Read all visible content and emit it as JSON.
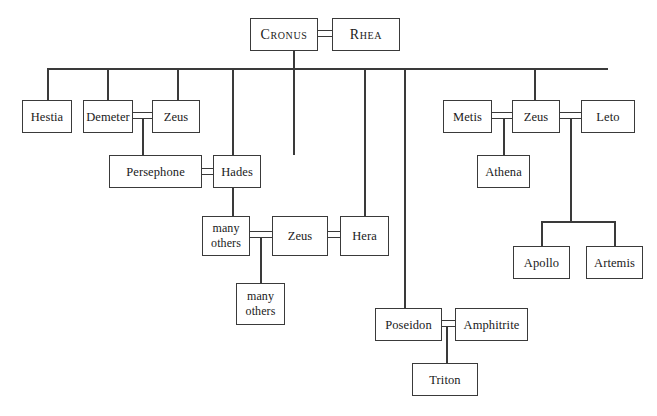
{
  "diagram": {
    "type": "family-tree",
    "line_color": "#3a3a3a",
    "box_fill": "#ffffff",
    "nodes": [
      {
        "id": "cronus",
        "label": "Cronus",
        "style": "smallcaps",
        "x": 250,
        "y": 18,
        "w": 68,
        "h": 33
      },
      {
        "id": "rhea",
        "label": "Rhea",
        "style": "smallcaps",
        "x": 332,
        "y": 18,
        "w": 68,
        "h": 33
      },
      {
        "id": "hestia",
        "label": "Hestia",
        "style": "normal",
        "x": 22,
        "y": 100,
        "w": 50,
        "h": 33
      },
      {
        "id": "demeter",
        "label": "Demeter",
        "style": "normal",
        "x": 83,
        "y": 100,
        "w": 50,
        "h": 33
      },
      {
        "id": "zeus1",
        "label": "Zeus",
        "style": "normal",
        "x": 152,
        "y": 100,
        "w": 48,
        "h": 33
      },
      {
        "id": "persephone",
        "label": "Persephone",
        "style": "normal",
        "x": 109,
        "y": 155,
        "w": 93,
        "h": 33
      },
      {
        "id": "hades",
        "label": "Hades",
        "style": "normal",
        "x": 213,
        "y": 155,
        "w": 48,
        "h": 33
      },
      {
        "id": "manyA",
        "label": "many\nothers",
        "style": "two-line",
        "x": 202,
        "y": 216,
        "w": 48,
        "h": 40
      },
      {
        "id": "zeus2",
        "label": "Zeus",
        "style": "normal",
        "x": 272,
        "y": 216,
        "w": 56,
        "h": 40
      },
      {
        "id": "hera",
        "label": "Hera",
        "style": "normal",
        "x": 340,
        "y": 216,
        "w": 49,
        "h": 40
      },
      {
        "id": "manyB",
        "label": "many\nothers",
        "style": "two-line",
        "x": 236,
        "y": 283,
        "w": 49,
        "h": 42
      },
      {
        "id": "metis",
        "label": "Metis",
        "style": "normal",
        "x": 443,
        "y": 100,
        "w": 49,
        "h": 33
      },
      {
        "id": "zeus3",
        "label": "Zeus",
        "style": "normal",
        "x": 512,
        "y": 100,
        "w": 48,
        "h": 33
      },
      {
        "id": "leto",
        "label": "Leto",
        "style": "normal",
        "x": 581,
        "y": 100,
        "w": 54,
        "h": 33
      },
      {
        "id": "athena",
        "label": "Athena",
        "style": "normal",
        "x": 477,
        "y": 155,
        "w": 53,
        "h": 33
      },
      {
        "id": "apollo",
        "label": "Apollo",
        "style": "normal",
        "x": 513,
        "y": 246,
        "w": 57,
        "h": 33
      },
      {
        "id": "artemis",
        "label": "Artemis",
        "style": "normal",
        "x": 586,
        "y": 246,
        "w": 57,
        "h": 33
      },
      {
        "id": "poseidon",
        "label": "Poseidon",
        "style": "normal",
        "x": 375,
        "y": 308,
        "w": 67,
        "h": 33
      },
      {
        "id": "amphitrite",
        "label": "Amphitrite",
        "style": "normal",
        "x": 455,
        "y": 308,
        "w": 73,
        "h": 33
      },
      {
        "id": "triton",
        "label": "Triton",
        "style": "normal",
        "x": 412,
        "y": 363,
        "w": 66,
        "h": 33
      }
    ],
    "marriages": [
      {
        "id": "cronus-rhea",
        "x": 318,
        "y": 30,
        "w": 14,
        "h": 5
      },
      {
        "id": "demeter-zeus",
        "x": 133,
        "y": 112,
        "w": 19,
        "h": 5
      },
      {
        "id": "persephone-hades",
        "x": 202,
        "y": 168,
        "w": 11,
        "h": 5
      },
      {
        "id": "manyothers-zeus",
        "x": 250,
        "y": 231,
        "w": 22,
        "h": 5
      },
      {
        "id": "zeus-hera",
        "x": 328,
        "y": 231,
        "w": 12,
        "h": 5
      },
      {
        "id": "metis-zeus",
        "x": 492,
        "y": 112,
        "w": 20,
        "h": 5
      },
      {
        "id": "zeus-leto",
        "x": 560,
        "y": 112,
        "w": 21,
        "h": 5
      },
      {
        "id": "poseidon-amphitrite",
        "x": 442,
        "y": 320,
        "w": 13,
        "h": 5
      }
    ],
    "connectors": {
      "descent_from_cronus_rhea": {
        "x": 293,
        "y_from": 35,
        "y_to": 68
      },
      "sibling_bar": {
        "y": 68,
        "x_from": 47,
        "x_to": 608
      },
      "drops": [
        {
          "id": "to-hestia",
          "x": 47,
          "y_from": 68,
          "y_to": 100
        },
        {
          "id": "to-demeter",
          "x": 107,
          "y_from": 68,
          "y_to": 100
        },
        {
          "id": "to-zeus1",
          "x": 177,
          "y_from": 68,
          "y_to": 100
        },
        {
          "id": "to-zeus2",
          "x": 232,
          "y_from": 68,
          "y_to": 216
        },
        {
          "id": "to-hades",
          "x": 293,
          "y_from": 68,
          "y_to": 155
        },
        {
          "id": "to-hera",
          "x": 364,
          "y_from": 68,
          "y_to": 216
        },
        {
          "id": "to-poseidon",
          "x": 404,
          "y_from": 68,
          "y_to": 308
        },
        {
          "id": "to-zeus3",
          "x": 534,
          "y_from": 68,
          "y_to": 100
        }
      ],
      "child_drops": [
        {
          "id": "persephone-from-demeter-zeus",
          "x": 142,
          "y_from": 117,
          "y_to": 155
        },
        {
          "id": "manyB-from-zeus2",
          "x": 260,
          "y_from": 236,
          "y_to": 283
        },
        {
          "id": "athena-from-metis-zeus",
          "x": 503,
          "y_from": 117,
          "y_to": 155
        },
        {
          "id": "triton-from-poseidon",
          "x": 446,
          "y_from": 325,
          "y_to": 363
        }
      ],
      "apollo_artemis_branch": {
        "stem": {
          "x": 570,
          "y_from": 117,
          "y_to": 221
        },
        "bar": {
          "y": 221,
          "x_from": 541,
          "x_to": 614
        },
        "to_apollo": {
          "x": 541,
          "y_from": 221,
          "y_to": 246
        },
        "to_artemis": {
          "x": 614,
          "y_from": 221,
          "y_to": 246
        }
      }
    }
  }
}
